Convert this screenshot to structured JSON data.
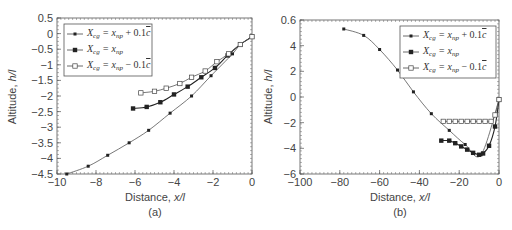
{
  "chart_data": [
    {
      "type": "line",
      "panel_label": "(a)",
      "xlabel": "Distance, x/l",
      "ylabel": "Altitude, h/l",
      "xlim": [
        -10,
        0
      ],
      "ylim": [
        -4.5,
        0.5
      ],
      "xticks": [
        "-10",
        "-8",
        "-6",
        "-4",
        "-2",
        "0"
      ],
      "yticks": [
        "0.5",
        "0",
        "-0.5",
        "-1",
        "-1.5",
        "-2",
        "-2.5",
        "-3",
        "-3.5",
        "-4",
        "-4.5"
      ],
      "legend_position": "upper left",
      "series": [
        {
          "name": "Xcg = xnp + 0.1c̄",
          "marker": "small-dot",
          "x": [
            -9.5,
            -8.4,
            -7.4,
            -6.3,
            -5.3,
            -4.2,
            -3.1,
            -2.1,
            -1.0,
            -0.6,
            0
          ],
          "y": [
            -4.5,
            -4.25,
            -3.9,
            -3.5,
            -3.1,
            -2.55,
            -2.0,
            -1.35,
            -0.65,
            -0.35,
            -0.1
          ]
        },
        {
          "name": "Xcg = xnp",
          "marker": "filled-square",
          "x": [
            -6.1,
            -5.4,
            -4.7,
            -4.0,
            -3.3,
            -2.6,
            -1.9,
            -1.25,
            -0.6,
            0
          ],
          "y": [
            -2.4,
            -2.35,
            -2.2,
            -1.95,
            -1.7,
            -1.4,
            -1.1,
            -0.7,
            -0.35,
            -0.1
          ]
        },
        {
          "name": "Xcg = xnp − 0.1c̄",
          "marker": "open-square",
          "x": [
            -5.7,
            -5.0,
            -4.4,
            -3.7,
            -3.1,
            -2.4,
            -1.8,
            -1.2,
            -0.6,
            0
          ],
          "y": [
            -1.9,
            -1.85,
            -1.75,
            -1.6,
            -1.4,
            -1.2,
            -0.9,
            -0.65,
            -0.35,
            -0.1
          ]
        }
      ]
    },
    {
      "type": "line",
      "panel_label": "(b)",
      "xlabel": "Distance, x/l",
      "ylabel": "Altitude, h/l",
      "xlim": [
        -100,
        0
      ],
      "ylim": [
        -6,
        6
      ],
      "xticks": [
        "-100",
        "-80",
        "-60",
        "-40",
        "-20",
        "0"
      ],
      "yticks": [
        "0.6",
        "4",
        "2",
        "0",
        "-2",
        "-4",
        "-6"
      ],
      "legend_position": "upper right",
      "series": [
        {
          "name": "Xcg = xnp + 0.1c̄",
          "marker": "small-dot",
          "x": [
            -78,
            -68,
            -60,
            -51,
            -43,
            -34,
            -25,
            -17,
            -9,
            0
          ],
          "y": [
            5.3,
            4.8,
            3.7,
            2.1,
            0.4,
            -1.3,
            -2.6,
            -3.7,
            -4.5,
            -0.2
          ]
        },
        {
          "name": "Xcg = xnp",
          "marker": "filled-square",
          "x": [
            -29,
            -25,
            -22,
            -19,
            -16,
            -13,
            -10,
            -8,
            -5,
            -2,
            0
          ],
          "y": [
            -3.4,
            -3.4,
            -3.6,
            -3.85,
            -4.1,
            -4.35,
            -4.5,
            -4.4,
            -3.8,
            -2.3,
            -0.2
          ]
        },
        {
          "name": "Xcg = xnp − 0.1c̄",
          "marker": "open-square",
          "x": [
            -28,
            -25,
            -22,
            -19,
            -16,
            -13,
            -10,
            -7,
            -4,
            -2,
            0
          ],
          "y": [
            -1.9,
            -1.9,
            -1.9,
            -1.9,
            -1.9,
            -1.9,
            -1.9,
            -1.9,
            -1.9,
            -1.4,
            -0.2
          ]
        }
      ]
    }
  ],
  "labels": {
    "a": {
      "panel": "(a)",
      "xlabel": "Distance, ",
      "xvar": "x/l",
      "ylabel": "Altitude, ",
      "yvar": "h/l"
    },
    "b": {
      "panel": "(b)",
      "xlabel": "Distance, ",
      "xvar": "x/l",
      "ylabel": "Altitude, ",
      "yvar": "h/l"
    }
  }
}
